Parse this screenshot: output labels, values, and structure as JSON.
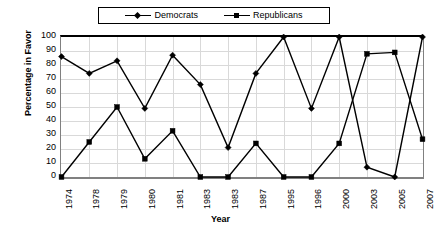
{
  "chart_data": {
    "type": "line",
    "title": "",
    "xlabel": "Year",
    "ylabel": "Percentage in Favor",
    "categories": [
      "1974",
      "1978",
      "1979",
      "1980",
      "1981",
      "1983",
      "1983",
      "1987",
      "1995",
      "1996",
      "2000",
      "2003",
      "2005",
      "2007"
    ],
    "series": [
      {
        "name": "Democrats",
        "marker": "diamond",
        "color": "#000000",
        "values": [
          86,
          74,
          83,
          49,
          87,
          66,
          21,
          74,
          100,
          49,
          100,
          7,
          0,
          100
        ]
      },
      {
        "name": "Republicans",
        "marker": "square",
        "color": "#000000",
        "values": [
          0,
          25,
          50,
          13,
          33,
          0,
          0,
          24,
          0,
          0,
          24,
          88,
          89,
          27
        ]
      }
    ],
    "ylim": [
      0,
      100
    ],
    "ytick_values": [
      0,
      10,
      20,
      30,
      40,
      50,
      60,
      70,
      80,
      90,
      100
    ],
    "ytick_labels": [
      "0",
      "10",
      "20",
      "30",
      "40",
      "50",
      "60",
      "70",
      "80",
      "90",
      "100"
    ],
    "grid": true,
    "grid_color": "#d9d9d9",
    "legend_position": "top",
    "axis_color": "#000000",
    "background": "#ffffff"
  },
  "legend": {
    "entries": [
      {
        "label": "Democrats",
        "marker": "diamond-marker-icon"
      },
      {
        "label": "Republicans",
        "marker": "square-marker-icon"
      }
    ]
  }
}
